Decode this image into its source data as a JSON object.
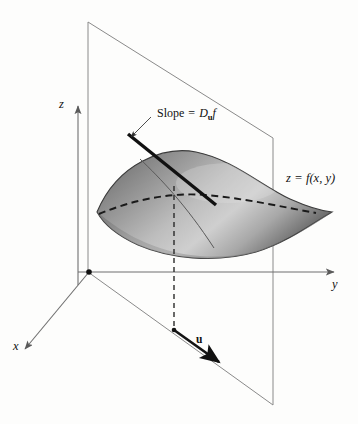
{
  "figure": {
    "background_color": "#fdfdfc"
  },
  "axes": [
    {
      "name": "z-axis",
      "label": "z",
      "direction": "up"
    },
    {
      "name": "y-axis",
      "label": "y",
      "direction": "right"
    },
    {
      "name": "x-axis",
      "label": "x",
      "direction": "down-left"
    }
  ],
  "labels": {
    "z_axis": "z",
    "y_axis": "y",
    "x_axis": "x",
    "surface_equation_z": "z",
    "surface_equation_eq": "=",
    "surface_equation_f": "f",
    "surface_equation_args": "(x, y)",
    "slope_text": "Slope",
    "slope_equals": "=",
    "slope_D": "D",
    "slope_sub_u": "u",
    "slope_f": "f",
    "unit_vector": "u"
  },
  "elements": [
    {
      "name": "vertical-plane",
      "description": "vertical cutting plane through the surface"
    },
    {
      "name": "surface",
      "description": "leaf-shaped graph of z = f(x, y)",
      "shading": "gray gradient"
    },
    {
      "name": "tangent-line",
      "description": "thick line whose slope is the directional derivative"
    },
    {
      "name": "trace-curve",
      "description": "curve of intersection of plane and surface"
    },
    {
      "name": "dashed-trace",
      "description": "dashed contour across the surface"
    },
    {
      "name": "dashed-drop-line",
      "description": "vertical dashed line from surface point to xy-plane"
    },
    {
      "name": "u-vector-arrow",
      "description": "bold unit vector u in the xy-plane"
    },
    {
      "name": "origin-dot",
      "description": "origin marker"
    }
  ],
  "colors": {
    "axis": "#6f6f6f",
    "plane_edge": "#8a8a8a",
    "ink": "#111111",
    "surface_light": "#d2d2d2",
    "surface_mid": "#9a9a9a",
    "surface_dark": "#606060"
  }
}
